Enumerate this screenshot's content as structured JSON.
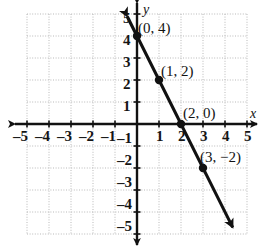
{
  "figure": {
    "kind": "coordinate-plane-line-graph",
    "background_color": "#ffffff",
    "ink_color": "#111111",
    "grid_color": "#b9b9b9"
  },
  "axes": {
    "x_axis_name": "x",
    "y_axis_name": "y",
    "xlim": [
      -5,
      5
    ],
    "ylim": [
      -5,
      5
    ],
    "grid": true,
    "grid_style": "dotted",
    "x_tick_labels": [
      "–5",
      "–4",
      "–3",
      "–2",
      "–1",
      "1",
      "2",
      "3",
      "4",
      "5"
    ],
    "x_tick_values": [
      -5,
      -4,
      -3,
      -2,
      -1,
      1,
      2,
      3,
      4,
      5
    ],
    "y_tick_labels": [
      "5",
      "4",
      "3",
      "2",
      "1",
      "–1",
      "–2",
      "–3",
      "–4",
      "–5"
    ],
    "y_tick_values": [
      5,
      4,
      3,
      2,
      1,
      -1,
      -2,
      -3,
      -4,
      -5
    ]
  },
  "chart_data": {
    "type": "line",
    "title": "",
    "xlabel": "x",
    "ylabel": "y",
    "xlim": [
      -5,
      5
    ],
    "ylim": [
      -5,
      5
    ],
    "grid": true,
    "legend": "none",
    "series": [
      {
        "name": "line",
        "equation": "y = -2x + 4",
        "slope": -2,
        "intercept": 4,
        "x": [
          0,
          1,
          2,
          3
        ],
        "values": [
          4,
          2,
          0,
          -2
        ],
        "marked_points": [
          {
            "x": 0,
            "y": 4,
            "label": "(0, 4)"
          },
          {
            "x": 1,
            "y": 2,
            "label": "(1, 2)"
          },
          {
            "x": 2,
            "y": 0,
            "label": "(2, 0)"
          },
          {
            "x": 3,
            "y": -2,
            "label": "(3, −2)"
          }
        ],
        "arrow_start": {
          "x": -0.45,
          "y": 4.9
        },
        "arrow_end": {
          "x": 4.35,
          "y": -4.7
        }
      }
    ],
    "annotations": [
      {
        "text": "(0, 4)",
        "x": 0,
        "y": 4
      },
      {
        "text": "(1, 2)",
        "x": 1,
        "y": 2
      },
      {
        "text": "(2, 0)",
        "x": 2,
        "y": 0
      },
      {
        "text": "(3, −2)",
        "x": 3,
        "y": -2
      }
    ]
  },
  "point_labels": [
    {
      "text": "(0, 4)",
      "left": 138,
      "top": 21
    },
    {
      "text": "(1, 2)",
      "left": 161,
      "top": 64
    },
    {
      "text": "(2, 0)",
      "left": 183,
      "top": 106
    },
    {
      "text": "(3, −2)",
      "left": 200,
      "top": 150
    }
  ],
  "x_tick_label_items": [
    {
      "text": "–5",
      "left": 13,
      "top": 129
    },
    {
      "text": "–4",
      "left": 35,
      "top": 129
    },
    {
      "text": "–3",
      "left": 57,
      "top": 129
    },
    {
      "text": "–2",
      "left": 79,
      "top": 129
    },
    {
      "text": "–1",
      "left": 101,
      "top": 129
    },
    {
      "text": "1",
      "left": 156,
      "top": 129
    },
    {
      "text": "2",
      "left": 178,
      "top": 129
    },
    {
      "text": "3",
      "left": 200,
      "top": 129
    },
    {
      "text": "4",
      "left": 222,
      "top": 129
    },
    {
      "text": "5",
      "left": 244,
      "top": 129
    }
  ],
  "y_tick_label_items": [
    {
      "text": "5",
      "left": 123,
      "top": 11
    },
    {
      "text": "4",
      "left": 123,
      "top": 33
    },
    {
      "text": "3",
      "left": 123,
      "top": 55
    },
    {
      "text": "2",
      "left": 123,
      "top": 77
    },
    {
      "text": "1",
      "left": 123,
      "top": 99
    },
    {
      "text": "–1",
      "left": 117,
      "top": 131
    },
    {
      "text": "–2",
      "left": 117,
      "top": 153
    },
    {
      "text": "–3",
      "left": 117,
      "top": 175
    },
    {
      "text": "–4",
      "left": 117,
      "top": 197
    },
    {
      "text": "–5",
      "left": 117,
      "top": 219
    }
  ],
  "axis_names": [
    {
      "text": "x",
      "left": 250,
      "top": 107
    },
    {
      "text": "y",
      "left": 143,
      "top": 3
    }
  ]
}
